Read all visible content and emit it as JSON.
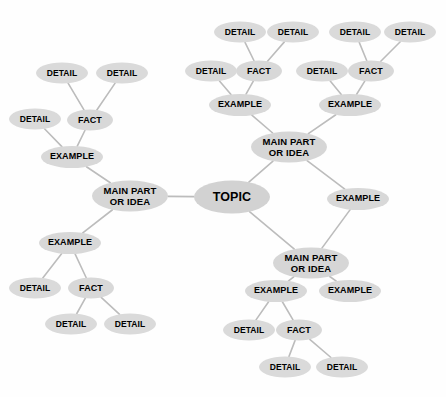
{
  "diagram": {
    "type": "mind-map",
    "background_color": "#fefefe",
    "node_fill_color": "#d6d6d6",
    "edge_color": "#bcbcbc",
    "text_color": "#000000",
    "labels": {
      "topic": "TOPIC",
      "main": "MAIN PART\nOR IDEA",
      "example": "EXAMPLE",
      "fact": "FACT",
      "detail": "DETAIL"
    },
    "nodes": [
      {
        "id": "topic",
        "label": "TOPIC",
        "kind": "topic",
        "x": 232,
        "y": 197,
        "w": 76,
        "h": 33
      },
      {
        "id": "main-left",
        "label": "MAIN PART\nOR IDEA",
        "kind": "main",
        "x": 130,
        "y": 196,
        "w": 76,
        "h": 31
      },
      {
        "id": "main-upper",
        "label": "MAIN PART\nOR IDEA",
        "kind": "main",
        "x": 289,
        "y": 147,
        "w": 76,
        "h": 31
      },
      {
        "id": "main-lower",
        "label": "MAIN PART\nOR IDEA",
        "kind": "main",
        "x": 311,
        "y": 263,
        "w": 76,
        "h": 31
      },
      {
        "id": "ex-l1",
        "label": "EXAMPLE",
        "kind": "example",
        "x": 72,
        "y": 157,
        "w": 62,
        "h": 22
      },
      {
        "id": "ex-l2",
        "label": "EXAMPLE",
        "kind": "example",
        "x": 70,
        "y": 243,
        "w": 62,
        "h": 22
      },
      {
        "id": "fact-l1",
        "label": "FACT",
        "kind": "fact",
        "x": 90,
        "y": 120,
        "w": 46,
        "h": 21
      },
      {
        "id": "det-l1a",
        "label": "DETAIL",
        "kind": "detail",
        "x": 35,
        "y": 119,
        "w": 52,
        "h": 21
      },
      {
        "id": "det-l1b",
        "label": "DETAIL",
        "kind": "detail",
        "x": 62,
        "y": 73,
        "w": 52,
        "h": 21
      },
      {
        "id": "det-l1c",
        "label": "DETAIL",
        "kind": "detail",
        "x": 122,
        "y": 73,
        "w": 52,
        "h": 21
      },
      {
        "id": "fact-l2",
        "label": "FACT",
        "kind": "fact",
        "x": 91,
        "y": 288,
        "w": 46,
        "h": 21
      },
      {
        "id": "det-l2a",
        "label": "DETAIL",
        "kind": "detail",
        "x": 35,
        "y": 288,
        "w": 52,
        "h": 21
      },
      {
        "id": "det-l2b",
        "label": "DETAIL",
        "kind": "detail",
        "x": 71,
        "y": 324,
        "w": 52,
        "h": 21
      },
      {
        "id": "det-l2c",
        "label": "DETAIL",
        "kind": "detail",
        "x": 130,
        "y": 324,
        "w": 52,
        "h": 21
      },
      {
        "id": "ex-u1",
        "label": "EXAMPLE",
        "kind": "example",
        "x": 240,
        "y": 105,
        "w": 62,
        "h": 22
      },
      {
        "id": "fact-u1",
        "label": "FACT",
        "kind": "fact",
        "x": 259,
        "y": 71,
        "w": 46,
        "h": 21
      },
      {
        "id": "det-u1a",
        "label": "DETAIL",
        "kind": "detail",
        "x": 211,
        "y": 71,
        "w": 52,
        "h": 21
      },
      {
        "id": "det-u1b",
        "label": "DETAIL",
        "kind": "detail",
        "x": 240,
        "y": 32,
        "w": 52,
        "h": 21
      },
      {
        "id": "det-u1c",
        "label": "DETAIL",
        "kind": "detail",
        "x": 293,
        "y": 32,
        "w": 52,
        "h": 21
      },
      {
        "id": "ex-u2",
        "label": "EXAMPLE",
        "kind": "example",
        "x": 350,
        "y": 105,
        "w": 62,
        "h": 22
      },
      {
        "id": "fact-u2",
        "label": "FACT",
        "kind": "fact",
        "x": 371,
        "y": 71,
        "w": 46,
        "h": 21
      },
      {
        "id": "det-u2a",
        "label": "DETAIL",
        "kind": "detail",
        "x": 322,
        "y": 71,
        "w": 52,
        "h": 21
      },
      {
        "id": "det-u2b",
        "label": "DETAIL",
        "kind": "detail",
        "x": 355,
        "y": 32,
        "w": 52,
        "h": 21
      },
      {
        "id": "det-u2c",
        "label": "DETAIL",
        "kind": "detail",
        "x": 410,
        "y": 32,
        "w": 52,
        "h": 21
      },
      {
        "id": "ex-mid",
        "label": "EXAMPLE",
        "kind": "example",
        "x": 358,
        "y": 199,
        "w": 62,
        "h": 22
      },
      {
        "id": "ex-b1",
        "label": "EXAMPLE",
        "kind": "example",
        "x": 276,
        "y": 291,
        "w": 62,
        "h": 22
      },
      {
        "id": "ex-b2",
        "label": "EXAMPLE",
        "kind": "example",
        "x": 350,
        "y": 291,
        "w": 62,
        "h": 22
      },
      {
        "id": "fact-b1",
        "label": "FACT",
        "kind": "fact",
        "x": 299,
        "y": 330,
        "w": 46,
        "h": 21
      },
      {
        "id": "det-b1a",
        "label": "DETAIL",
        "kind": "detail",
        "x": 249,
        "y": 330,
        "w": 52,
        "h": 21
      },
      {
        "id": "det-b1b",
        "label": "DETAIL",
        "kind": "detail",
        "x": 285,
        "y": 367,
        "w": 52,
        "h": 21
      },
      {
        "id": "det-b1c",
        "label": "DETAIL",
        "kind": "detail",
        "x": 342,
        "y": 367,
        "w": 52,
        "h": 21
      }
    ],
    "edges": [
      [
        "topic",
        "main-left"
      ],
      [
        "topic",
        "main-upper"
      ],
      [
        "topic",
        "main-lower"
      ],
      [
        "main-left",
        "ex-l1"
      ],
      [
        "main-left",
        "ex-l2"
      ],
      [
        "ex-l1",
        "fact-l1"
      ],
      [
        "ex-l1",
        "det-l1a"
      ],
      [
        "fact-l1",
        "det-l1b"
      ],
      [
        "fact-l1",
        "det-l1c"
      ],
      [
        "ex-l2",
        "fact-l2"
      ],
      [
        "ex-l2",
        "det-l2a"
      ],
      [
        "fact-l2",
        "det-l2b"
      ],
      [
        "fact-l2",
        "det-l2c"
      ],
      [
        "main-upper",
        "ex-u1"
      ],
      [
        "main-upper",
        "ex-u2"
      ],
      [
        "ex-u1",
        "fact-u1"
      ],
      [
        "ex-u1",
        "det-u1a"
      ],
      [
        "fact-u1",
        "det-u1b"
      ],
      [
        "fact-u1",
        "det-u1c"
      ],
      [
        "ex-u2",
        "fact-u2"
      ],
      [
        "ex-u2",
        "det-u2a"
      ],
      [
        "fact-u2",
        "det-u2b"
      ],
      [
        "fact-u2",
        "det-u2c"
      ],
      [
        "main-upper",
        "ex-mid"
      ],
      [
        "main-lower",
        "ex-mid"
      ],
      [
        "main-lower",
        "ex-b1"
      ],
      [
        "main-lower",
        "ex-b2"
      ],
      [
        "ex-b1",
        "fact-b1"
      ],
      [
        "ex-b1",
        "det-b1a"
      ],
      [
        "fact-b1",
        "det-b1b"
      ],
      [
        "fact-b1",
        "det-b1c"
      ]
    ]
  }
}
